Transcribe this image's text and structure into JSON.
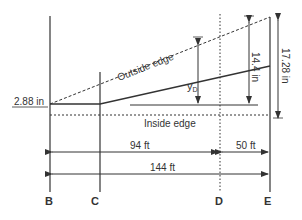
{
  "labels": {
    "outside_edge": "Outside edge",
    "inside_edge": "Inside edge",
    "left_offset": "2.88 in",
    "yd": "y",
    "yd_sub": "D",
    "dim_14_4": "14.4 in",
    "dim_17_28": "17.28 in",
    "dim_94": "94 ft",
    "dim_50": "50 ft",
    "dim_144": "144 ft"
  },
  "stations": [
    "B",
    "C",
    "D",
    "E"
  ],
  "colors": {
    "line": "#333333"
  }
}
